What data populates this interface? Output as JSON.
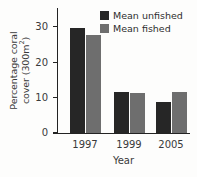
{
  "chart_data": {
    "type": "bar",
    "title": "",
    "xlabel": "Year",
    "ylabel_line1": "Percentage coral",
    "ylabel_line2": "cover (300m",
    "ylabel_sup": "2",
    "ylabel_close": ")",
    "categories": [
      "1997",
      "1999",
      "2005"
    ],
    "series": [
      {
        "name": "Mean unfished",
        "color": "#262626",
        "values": [
          29.5,
          11.6,
          8.6
        ]
      },
      {
        "name": "Mean fished",
        "color": "#6e6e6e",
        "values": [
          27.5,
          11.2,
          11.5
        ]
      }
    ],
    "ylim": [
      0,
      35
    ],
    "yticks": [
      0,
      10,
      20,
      30
    ],
    "ytick_labels": [
      "0",
      "10",
      "20",
      "30"
    ],
    "grid": false,
    "legend_position": "top-right"
  },
  "legend": {
    "items": [
      {
        "label": "Mean unfished",
        "swatch": "unfished"
      },
      {
        "label": "Mean fished",
        "swatch": "fished"
      }
    ]
  },
  "colors": {
    "unfished": "#262626",
    "fished": "#6e6e6e",
    "axis": "#232323",
    "text": "#3a3a3a",
    "background": "#fdfdfc"
  }
}
